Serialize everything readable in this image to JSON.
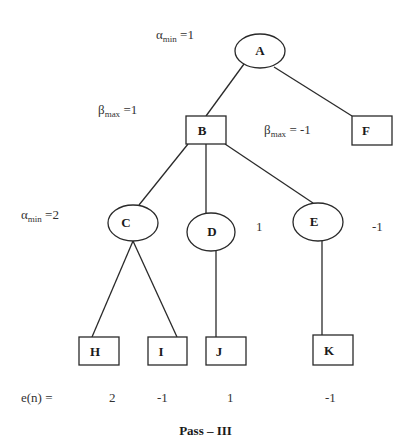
{
  "diagram": {
    "type": "game-tree",
    "caption": "Pass – III",
    "nodes": [
      {
        "id": "A",
        "shape": "ellipse",
        "label": "A"
      },
      {
        "id": "B",
        "shape": "box",
        "label": "B"
      },
      {
        "id": "F",
        "shape": "box",
        "label": "F"
      },
      {
        "id": "C",
        "shape": "ellipse",
        "label": "C"
      },
      {
        "id": "D",
        "shape": "ellipse",
        "label": "D"
      },
      {
        "id": "E",
        "shape": "ellipse",
        "label": "E"
      },
      {
        "id": "H",
        "shape": "box",
        "label": "H"
      },
      {
        "id": "I",
        "shape": "box",
        "label": "I"
      },
      {
        "id": "J",
        "shape": "box",
        "label": "J"
      },
      {
        "id": "K",
        "shape": "box",
        "label": "K"
      }
    ],
    "edges": [
      [
        "A",
        "B"
      ],
      [
        "A",
        "F"
      ],
      [
        "B",
        "C"
      ],
      [
        "B",
        "D"
      ],
      [
        "B",
        "E"
      ],
      [
        "C",
        "H"
      ],
      [
        "C",
        "I"
      ],
      [
        "D",
        "J"
      ],
      [
        "E",
        "K"
      ]
    ],
    "annotations": {
      "a_alpha": {
        "symbol": "α",
        "sub": "min",
        "value": " =1"
      },
      "b_beta": {
        "symbol": "β",
        "sub": "max",
        "value": " =1"
      },
      "f_beta": {
        "symbol": "β",
        "sub": "max",
        "value": " = -1"
      },
      "c_alpha": {
        "symbol": "α",
        "sub": "min",
        "value": " =2"
      },
      "d_value": "1",
      "e_value": "-1"
    },
    "evaluation": {
      "label": "e(n) =",
      "values": {
        "H": "2",
        "I": "-1",
        "J": "1",
        "K": "-1"
      }
    }
  }
}
